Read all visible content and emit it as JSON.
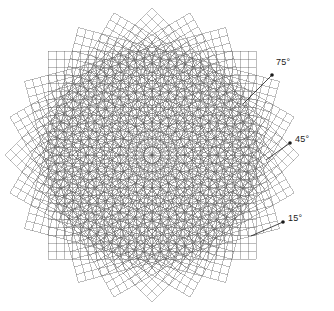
{
  "figure": {
    "background_color": "#ffffff",
    "line_color": "#555555",
    "marker_color": "#1a1a1a",
    "center": {
      "x": 152,
      "y": 155
    },
    "grid": {
      "half_size": 104,
      "cell_size": 8,
      "cells_per_side": 26,
      "stroke_width": 0.5
    },
    "layers": [
      {
        "name": "grid-layer-0",
        "angle_deg": 0,
        "label": "0°",
        "labelled": false
      },
      {
        "name": "grid-layer-15",
        "angle_deg": 15,
        "label": "15°",
        "labelled": true
      },
      {
        "name": "grid-layer-30",
        "angle_deg": 30,
        "label": "30°",
        "labelled": false
      },
      {
        "name": "grid-layer-45",
        "angle_deg": 45,
        "label": "45°",
        "labelled": true
      },
      {
        "name": "grid-layer-60",
        "angle_deg": 60,
        "label": "60°",
        "labelled": false
      },
      {
        "name": "grid-layer-75",
        "angle_deg": 75,
        "label": "75°",
        "labelled": true
      }
    ],
    "annotations": [
      {
        "name": "annotation-75",
        "text": "75°",
        "dot": {
          "x": 272,
          "y": 75
        },
        "leader_end": {
          "x": 243,
          "y": 104
        },
        "label_pos": {
          "x": 276,
          "y": 57
        }
      },
      {
        "name": "annotation-45",
        "text": "45°",
        "dot": {
          "x": 290,
          "y": 143
        },
        "leader_end": {
          "x": 266,
          "y": 160
        },
        "label_pos": {
          "x": 295,
          "y": 134
        }
      },
      {
        "name": "annotation-15",
        "text": "15°",
        "dot": {
          "x": 283,
          "y": 222
        },
        "leader_end": {
          "x": 251,
          "y": 236
        },
        "label_pos": {
          "x": 288,
          "y": 213
        }
      }
    ]
  },
  "chart_data": {
    "type": "diagram",
    "series": [
      {
        "name": "grid 0°",
        "rotation_deg": 0,
        "cells": 26,
        "cell_size_px": 8,
        "annotated": false
      },
      {
        "name": "grid 15°",
        "rotation_deg": 15,
        "cells": 26,
        "cell_size_px": 8,
        "annotated": true
      },
      {
        "name": "grid 30°",
        "rotation_deg": 30,
        "cells": 26,
        "cell_size_px": 8,
        "annotated": false
      },
      {
        "name": "grid 45°",
        "rotation_deg": 45,
        "cells": 26,
        "cell_size_px": 8,
        "annotated": true
      },
      {
        "name": "grid 60°",
        "rotation_deg": 60,
        "cells": 26,
        "cell_size_px": 8,
        "annotated": false
      },
      {
        "name": "grid 75°",
        "rotation_deg": 75,
        "cells": 26,
        "cell_size_px": 8,
        "annotated": true
      }
    ],
    "annotation_labels": [
      "75°",
      "45°",
      "15°"
    ],
    "xlabel": "",
    "ylabel": "",
    "grid": true,
    "legend": "none"
  }
}
